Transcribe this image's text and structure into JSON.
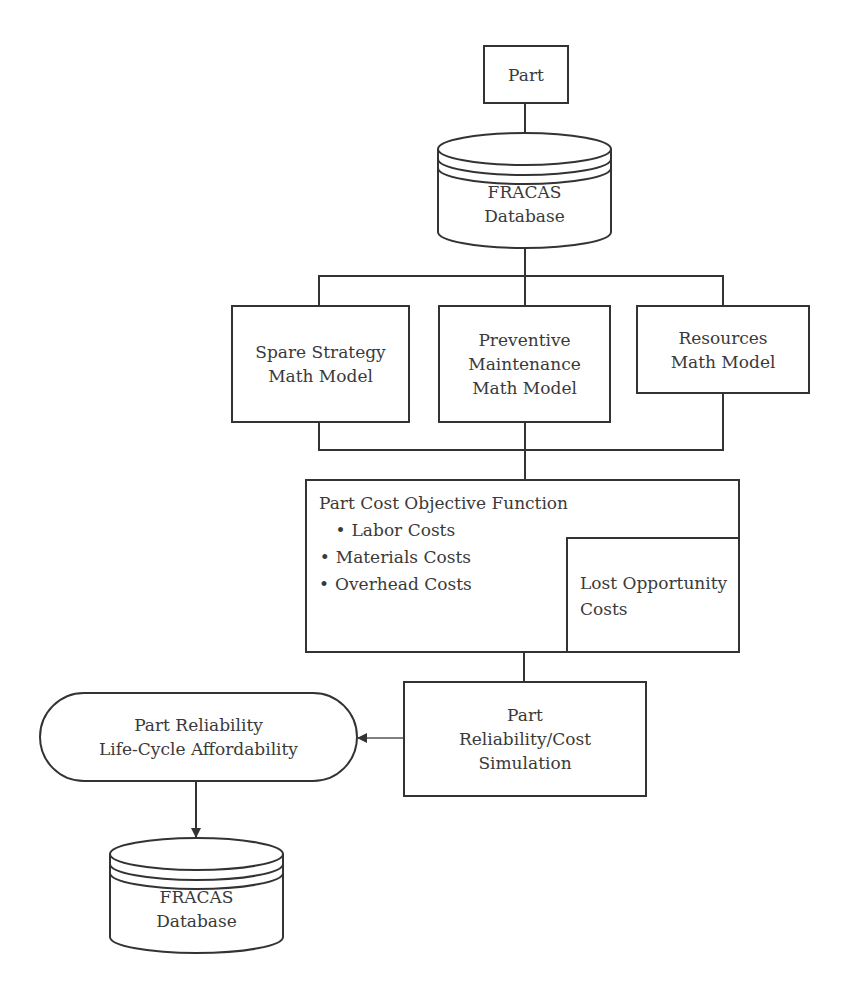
{
  "diagram": {
    "nodes": {
      "part": {
        "label": "Part"
      },
      "fracas_top": {
        "lines": [
          "FRACAS",
          "Database"
        ]
      },
      "spare_strategy": {
        "lines": [
          "Spare Strategy",
          "Math Model"
        ]
      },
      "preventive_maintenance": {
        "lines": [
          "Preventive",
          "Maintenance",
          "Math Model"
        ]
      },
      "resources": {
        "lines": [
          "Resources",
          "Math Model"
        ]
      },
      "objective_function": {
        "title": "Part Cost Objective Function",
        "bullets": [
          "Labor Costs",
          "Materials Costs",
          "Overhead Costs"
        ],
        "sub_box": {
          "lines": [
            "Lost Opportunity",
            "Costs"
          ]
        }
      },
      "simulation": {
        "lines": [
          "Part",
          "Reliability/Cost",
          "Simulation"
        ]
      },
      "affordability": {
        "lines": [
          "Part Reliability",
          "Life-Cycle Affordability"
        ]
      },
      "fracas_bottom": {
        "lines": [
          "FRACAS",
          "Database"
        ]
      }
    },
    "edges": [
      {
        "from": "Part",
        "to": "FRACAS Database (top)",
        "arrow": false
      },
      {
        "from": "FRACAS Database (top)",
        "to": "Spare Strategy / Preventive Maintenance / Resources Math Models",
        "arrow": false
      },
      {
        "from": "Math Models",
        "to": "Part Cost Objective Function",
        "arrow": false
      },
      {
        "from": "Part Cost Objective Function",
        "to": "Part Reliability/Cost Simulation",
        "arrow": false
      },
      {
        "from": "Part Reliability/Cost Simulation",
        "to": "Part Reliability Life-Cycle Affordability",
        "arrow": true
      },
      {
        "from": "Part Reliability Life-Cycle Affordability",
        "to": "FRACAS Database (bottom)",
        "arrow": true
      }
    ],
    "colors": {
      "stroke": "#333333",
      "text": "#3a3a3a",
      "background": "#ffffff"
    }
  }
}
